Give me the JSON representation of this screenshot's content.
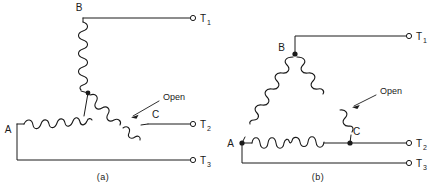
{
  "figure": {
    "background_color": "#ffffff",
    "line_color": "#1a1a1a",
    "panels": [
      {
        "id": "a",
        "caption": "(a)",
        "connection_type": "wye",
        "node_labels": [
          "A",
          "B",
          "C"
        ],
        "terminal_labels": [
          {
            "base": "T",
            "sub": "1"
          },
          {
            "base": "T",
            "sub": "2"
          },
          {
            "base": "T",
            "sub": "3"
          }
        ],
        "annotation": "Open",
        "annotation_target": "winding between center node and C",
        "junction_dots": 1
      },
      {
        "id": "b",
        "caption": "(b)",
        "connection_type": "delta",
        "node_labels": [
          "A",
          "B",
          "C"
        ],
        "terminal_labels": [
          {
            "base": "T",
            "sub": "1"
          },
          {
            "base": "T",
            "sub": "2"
          },
          {
            "base": "T",
            "sub": "3"
          }
        ],
        "annotation": "Open",
        "annotation_target": "winding between B and C",
        "junction_dots": 3
      }
    ]
  }
}
